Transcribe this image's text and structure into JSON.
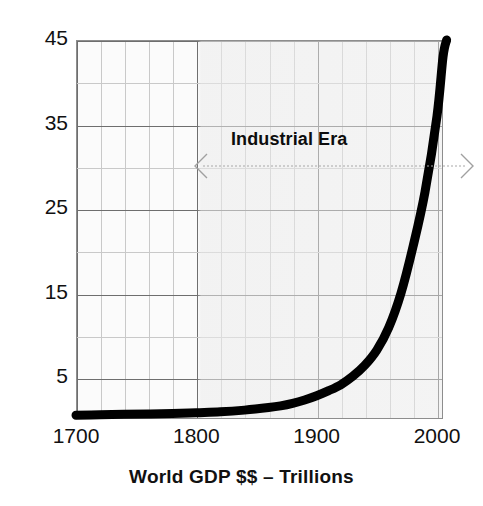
{
  "chart_data": {
    "type": "line",
    "title": "World GDP $$ – Trillions",
    "xlabel": "",
    "ylabel": "",
    "xlim": [
      1700,
      2010
    ],
    "ylim": [
      0,
      45
    ],
    "grid": true,
    "legend": null,
    "x_tick_labels": [
      "1700",
      "1800",
      "1900",
      "2000"
    ],
    "x_tick_values": [
      1700,
      1800,
      1900,
      2000
    ],
    "y_tick_labels": [
      "5",
      "15",
      "25",
      "35",
      "45"
    ],
    "y_tick_values": [
      5,
      15,
      25,
      35,
      45
    ],
    "x_minor_step": 20,
    "y_minor_step": 5,
    "series": [
      {
        "name": "World GDP",
        "x": [
          1700,
          1720,
          1740,
          1760,
          1780,
          1800,
          1820,
          1840,
          1860,
          1870,
          1880,
          1890,
          1900,
          1910,
          1920,
          1930,
          1940,
          1950,
          1960,
          1970,
          1980,
          1990,
          2000,
          2005,
          2008
        ],
        "values": [
          0.6,
          0.65,
          0.7,
          0.75,
          0.8,
          0.9,
          1.0,
          1.2,
          1.5,
          1.7,
          2.0,
          2.4,
          2.9,
          3.5,
          4.2,
          5.2,
          6.5,
          8.3,
          11.0,
          15.0,
          20.5,
          27.0,
          36.0,
          43.0,
          45.0
        ]
      }
    ],
    "annotations": [
      {
        "name": "industrial-era",
        "text": "Industrial Era",
        "arrow": "double-headed",
        "x_start": 1800,
        "x_end": 2010,
        "y": 30
      }
    ],
    "colors": {
      "curve": "#000000",
      "grid_minor": "#c9c9c9",
      "grid_major": "#6e6e6e",
      "frame": "#8d8d8d",
      "text": "#111111",
      "annotation_arrow": "#9a9a9a",
      "plot_background": "#fbfbfb"
    }
  }
}
